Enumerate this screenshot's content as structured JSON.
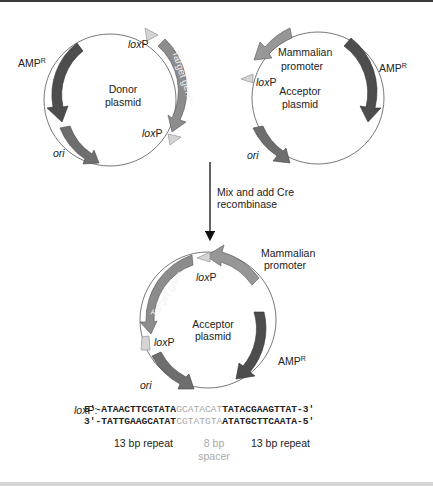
{
  "colors": {
    "amp": "#4d4d4d",
    "gene": "#8c8c8c",
    "ori": "#6e6e6e",
    "promoter": "#979797",
    "loxp": "#d4d4d4",
    "spacer_text": "#a8a8a8",
    "text": "#222222"
  },
  "donor": {
    "name_line1": "Donor",
    "name_line2": "plasmid",
    "amp_label": "AMP",
    "amp_sup": "R",
    "ori_label": "ori",
    "gene_label": "Target gene",
    "loxp_top_italic": "lox",
    "loxp_top_rest": "P",
    "loxp_bottom_italic": "lox",
    "loxp_bottom_rest": "P"
  },
  "acceptor": {
    "name_line1": "Acceptor",
    "name_line2": "plasmid",
    "promoter_line1": "Mammalian",
    "promoter_line2": "promoter",
    "amp_label": "AMP",
    "amp_sup": "R",
    "ori_label": "ori",
    "loxp_italic": "lox",
    "loxp_rest": "P"
  },
  "step": {
    "line1": "Mix and add Cre",
    "line2": "recombinase"
  },
  "product": {
    "name_line1": "Acceptor",
    "name_line2": "plasmid",
    "promoter_line1": "Mammalian",
    "promoter_line2": "promoter",
    "gene_label": "Target gene",
    "amp_label": "AMP",
    "amp_sup": "R",
    "ori_label": "ori",
    "loxp_top_italic": "lox",
    "loxp_top_rest": "P",
    "loxp_left_italic": "lox",
    "loxp_left_rest": "P"
  },
  "loxp_sequence": {
    "label_italic": "lox",
    "label_rest": "P:",
    "top": {
      "prefix": "5'-",
      "left": "ATAACTTCGTATA",
      "spacer": "GCATACAT",
      "right": "TATACGAAGTTAT",
      "suffix": "-3'"
    },
    "bottom": {
      "prefix": "3'-",
      "left": "TATTGAAGCATAT",
      "spacer": "CGTATGTA",
      "right": "ATATGCTTCAATA",
      "suffix": "-5'"
    },
    "left_caption": "13 bp repeat",
    "spacer_caption_line1": "8 bp",
    "spacer_caption_line2": "spacer",
    "right_caption": "13 bp repeat"
  }
}
